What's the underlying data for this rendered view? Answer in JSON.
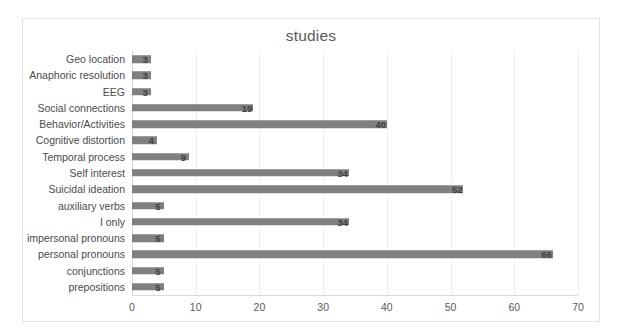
{
  "chart_data": {
    "type": "bar",
    "orientation": "horizontal",
    "title": "studies",
    "xlabel": "",
    "ylabel": "",
    "xlim": [
      0,
      70
    ],
    "xticks": [
      "0",
      "10",
      "20",
      "30",
      "40",
      "50",
      "60",
      "70"
    ],
    "grid": true,
    "legend": false,
    "legend_position": "none",
    "bar_color": "#808080",
    "data_labels_shown": true,
    "categories": [
      "Geo location",
      "Anaphoric resolution",
      "EEG",
      "Social connections",
      "Behavior/Activities",
      "Cognitive distortion",
      "Temporal process",
      "Self interest",
      "Suicidal ideation",
      "auxiliary verbs",
      "I only",
      "impersonal pronouns",
      "personal pronouns",
      "conjunctions",
      "prepositions"
    ],
    "values": [
      3,
      3,
      3,
      19,
      40,
      4,
      9,
      34,
      52,
      5,
      34,
      5,
      66,
      5,
      5
    ],
    "value_labels": [
      "3",
      "3",
      "3",
      "19",
      "40",
      "4",
      "9",
      "34",
      "52",
      "5",
      "34",
      "5",
      "66",
      "5",
      "5"
    ]
  }
}
